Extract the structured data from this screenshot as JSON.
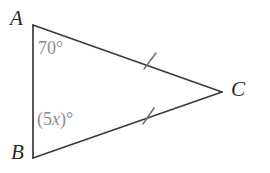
{
  "figure": {
    "kind": "triangle-diagram",
    "background_color": "#ffffff",
    "stroke_color": "#3a3a3a",
    "label_color": "#2b2b2b",
    "angle_label_color": "#8d8d8d",
    "vertices": {
      "A": {
        "label": "A",
        "x": 33,
        "y": 25
      },
      "B": {
        "label": "B",
        "x": 33,
        "y": 158
      },
      "C": {
        "label": "C",
        "x": 222,
        "y": 92
      }
    },
    "sides": [
      {
        "name": "AB",
        "from": "A",
        "to": "B",
        "tick_marks": 0
      },
      {
        "name": "AC",
        "from": "A",
        "to": "C",
        "tick_marks": 1
      },
      {
        "name": "BC",
        "from": "B",
        "to": "C",
        "tick_marks": 1
      }
    ],
    "tick_marks": [
      {
        "on_side": "AC",
        "x": 150,
        "y": 61
      },
      {
        "on_side": "BC",
        "x": 148,
        "y": 116
      }
    ],
    "angles": [
      {
        "at_vertex": "A",
        "text": "70°",
        "measure": 70,
        "unit": "degrees",
        "is_known": true
      },
      {
        "at_vertex": "B",
        "prefix": "(5",
        "variable": "x",
        "suffix": ")°",
        "text": "(5x)°",
        "is_known": false
      }
    ]
  }
}
